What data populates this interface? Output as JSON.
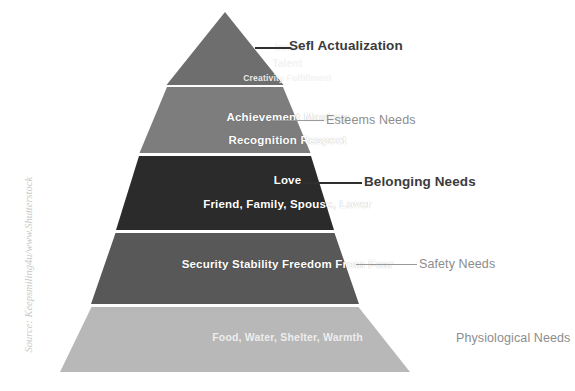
{
  "figure": {
    "title_text": "Maslow's Hierarchy of Needs pyramid",
    "source_credit": "Source: Keepsmiling4u/www.Shutterstock"
  },
  "colors": {
    "tier_self_actualization": "#6e6e6e",
    "tier_esteem": "#7d7d7d",
    "tier_belonging": "#2b2b2b",
    "tier_safety": "#585858",
    "tier_physiological": "#b8b8b8",
    "divider": "#d8d8d8",
    "label_strong": "#3b3b3b",
    "label_soft": "#8d8d8d",
    "leader_strong": "#2f2f2f",
    "leader_soft": "#9a9a9a",
    "inner_text": "#ffffff",
    "background": "#ffffff",
    "credit_text": "#c9c9c9"
  },
  "tiers": [
    {
      "id": "self-actualization",
      "callout": "Sefl Actualization",
      "callout_style": "strong",
      "inner_lines": [
        "Inner",
        "Talent",
        "Creativity Fulfillment"
      ],
      "fill": "#6e6e6e",
      "has_leader": true
    },
    {
      "id": "esteem",
      "callout": "Esteems Needs",
      "callout_style": "soft",
      "inner_lines": [
        "Achievement Mastery",
        "Recognition Respect"
      ],
      "fill": "#7d7d7d",
      "has_leader": true
    },
    {
      "id": "belonging",
      "callout": "Belonging Needs",
      "callout_style": "strong",
      "inner_lines": [
        "Love",
        "Friend, Family, Spouse, Lover"
      ],
      "fill": "#2b2b2b",
      "has_leader": true
    },
    {
      "id": "safety",
      "callout": "Safety Needs",
      "callout_style": "soft",
      "inner_lines": [
        "Security Stability Freedom From Fear"
      ],
      "fill": "#585858",
      "has_leader": true
    },
    {
      "id": "physiological",
      "callout": "Physiological Needs",
      "callout_style": "soft",
      "inner_lines": [
        "Food, Water, Shelter, Warmth"
      ],
      "fill": "#b8b8b8",
      "has_leader": false
    }
  ]
}
